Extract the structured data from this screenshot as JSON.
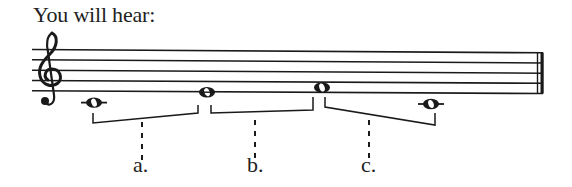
{
  "title": "You will hear:",
  "staff": {
    "clef": "treble",
    "lines": 5,
    "ending": "final-double-barline"
  },
  "notes": [
    {
      "pitch": "C4",
      "duration": "whole",
      "ledger_line": true
    },
    {
      "pitch": "E4",
      "duration": "whole",
      "ledger_line": false
    },
    {
      "pitch": "F4",
      "duration": "whole",
      "ledger_line": false
    },
    {
      "pitch": "C4",
      "duration": "whole",
      "ledger_line": true
    }
  ],
  "intervals": [
    {
      "label": "a.",
      "from_note": 0,
      "to_note": 1
    },
    {
      "label": "b.",
      "from_note": 1,
      "to_note": 2
    },
    {
      "label": "c.",
      "from_note": 2,
      "to_note": 3
    }
  ],
  "colors": {
    "ink": "#1a1a1a",
    "background": "#ffffff"
  }
}
